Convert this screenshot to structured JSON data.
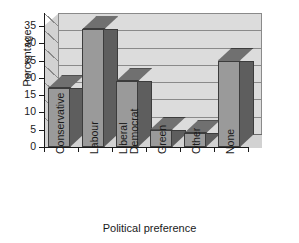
{
  "chart_data": {
    "type": "bar",
    "title": "",
    "xlabel": "Political preference",
    "ylabel": "Percentage",
    "categories": [
      "Conservative",
      "Labour",
      "Liberal Democrat",
      "Green",
      "Other",
      "None"
    ],
    "category_lines": [
      [
        "Conservative"
      ],
      [
        "Labour"
      ],
      [
        "Liberal",
        "Democrat"
      ],
      [
        "Green"
      ],
      [
        "Other"
      ],
      [
        "None"
      ]
    ],
    "values": [
      17,
      34,
      19,
      5,
      4,
      25
    ],
    "ylim": [
      0,
      35
    ],
    "yticks": [
      0,
      5,
      10,
      15,
      20,
      25,
      30,
      35
    ],
    "ytick_labels": [
      "0",
      "5",
      "10",
      "15",
      "20",
      "25",
      "30",
      "35"
    ],
    "grid": true,
    "grid_axis": "y",
    "legend": false,
    "style": "3d-column",
    "colors": {
      "bar_face": "#9a9a9a",
      "bar_top": "#707070",
      "bar_side": "#5e5e5e",
      "bar_outline": "#3c3c3c",
      "wall_back": "#dcdcdc",
      "wall_side": "#d2d2d2",
      "gridline": "#8a8a8a",
      "axis": "#1a1a1a",
      "text": "#1a1a1a",
      "background": "#ffffff"
    }
  }
}
